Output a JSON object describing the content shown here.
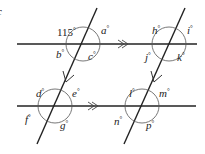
{
  "figure": {
    "type": "parallel-lines-transversals",
    "stroke_color": "#222222",
    "background": "#ffffff",
    "parallel_markers": "double-chevron",
    "lines": {
      "horizontal_top": {
        "x1": 17,
        "y1": 44,
        "x2": 197,
        "y2": 44,
        "marker": ">>"
      },
      "horizontal_bottom": {
        "x1": 17,
        "y1": 106,
        "x2": 196,
        "y2": 106,
        "marker": ">>"
      },
      "transversal_left": {
        "x1": 97,
        "y1": 8,
        "x2": 37,
        "y2": 144,
        "marker": ">"
      },
      "transversal_right": {
        "x1": 185,
        "y1": 8,
        "x2": 124,
        "y2": 144,
        "marker": ">"
      }
    },
    "stray_mark": "c",
    "angles": [
      {
        "id": "given",
        "text": "115",
        "unit": "°",
        "x": 57,
        "y": 36
      },
      {
        "id": "a",
        "text": "a",
        "unit": "°",
        "x": 101,
        "y": 34
      },
      {
        "id": "b",
        "text": "b",
        "unit": "°",
        "x": 56,
        "y": 58
      },
      {
        "id": "c",
        "text": "c",
        "unit": "°",
        "x": 88,
        "y": 60
      },
      {
        "id": "h",
        "text": "h",
        "unit": "°",
        "x": 152,
        "y": 34
      },
      {
        "id": "i",
        "text": "i",
        "unit": "°",
        "x": 187,
        "y": 34
      },
      {
        "id": "j",
        "text": "j",
        "unit": "°",
        "x": 145,
        "y": 61
      },
      {
        "id": "k",
        "text": "k",
        "unit": "°",
        "x": 177,
        "y": 61
      },
      {
        "id": "d",
        "text": "d",
        "unit": "°",
        "x": 36,
        "y": 97
      },
      {
        "id": "e",
        "text": "e",
        "unit": "°",
        "x": 72,
        "y": 97
      },
      {
        "id": "f",
        "text": "f",
        "unit": "°",
        "x": 25,
        "y": 123
      },
      {
        "id": "g",
        "text": "g",
        "unit": "°",
        "x": 60,
        "y": 129
      },
      {
        "id": "l",
        "text": "l",
        "unit": "°",
        "x": 129,
        "y": 97
      },
      {
        "id": "m",
        "text": "m",
        "unit": "°",
        "x": 159,
        "y": 97
      },
      {
        "id": "n",
        "text": "n",
        "unit": "°",
        "x": 114,
        "y": 125
      },
      {
        "id": "p",
        "text": "p",
        "unit": "°",
        "x": 146,
        "y": 129
      }
    ]
  }
}
